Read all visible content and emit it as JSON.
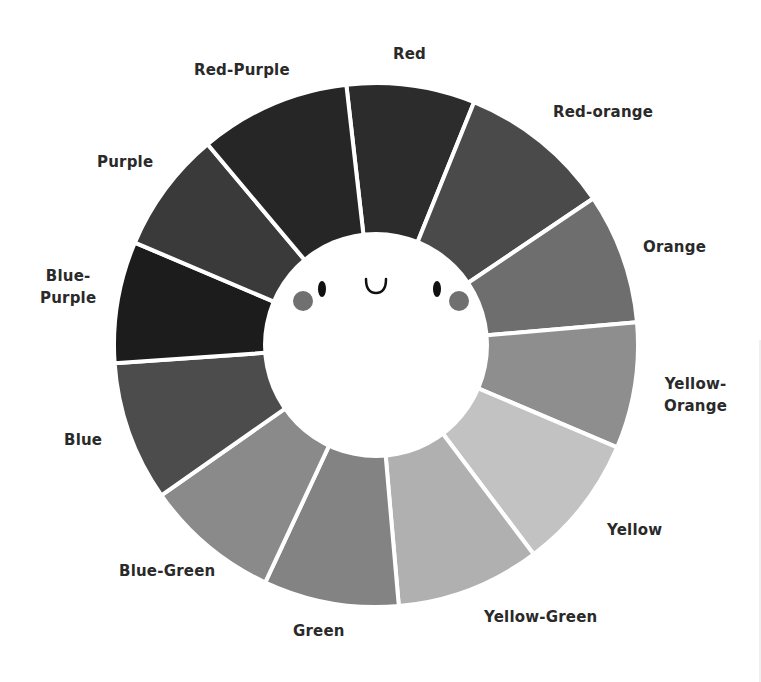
{
  "diagram": {
    "type": "color-wheel",
    "segment_count": 12,
    "center": {
      "x": 376,
      "y": 345
    },
    "outer_radius": 262,
    "inner_radius": 113,
    "divider_color": "#ffffff",
    "segments": [
      {
        "name": "Red",
        "start_deg": -6.5,
        "end_deg": 22,
        "fill": "#2c2c2c"
      },
      {
        "name": "Red-orange",
        "start_deg": 22,
        "end_deg": 56,
        "fill": "#4a4a4a"
      },
      {
        "name": "Orange",
        "start_deg": 56,
        "end_deg": 85,
        "fill": "#6e6e6e"
      },
      {
        "name": "Yellow-Orange",
        "start_deg": 85,
        "end_deg": 113,
        "fill": "#8e8e8e"
      },
      {
        "name": "Yellow",
        "start_deg": 113,
        "end_deg": 143,
        "fill": "#c2c2c2"
      },
      {
        "name": "Yellow-Green",
        "start_deg": 143,
        "end_deg": 175,
        "fill": "#b0b0b0"
      },
      {
        "name": "Green",
        "start_deg": 175,
        "end_deg": 205,
        "fill": "#838383"
      },
      {
        "name": "Blue-Green",
        "start_deg": 205,
        "end_deg": 235,
        "fill": "#8a8a8a"
      },
      {
        "name": "Blue",
        "start_deg": 235,
        "end_deg": 266,
        "fill": "#4c4c4c"
      },
      {
        "name": "Blue-Purple",
        "start_deg": 266,
        "end_deg": 293,
        "fill": "#1c1c1c"
      },
      {
        "name": "Purple",
        "start_deg": 293,
        "end_deg": 320,
        "fill": "#3a3a3a"
      },
      {
        "name": "Red-Purple",
        "start_deg": 320,
        "end_deg": 353.5,
        "fill": "#262626"
      }
    ],
    "face": {
      "eyes": [
        {
          "x": 322,
          "y": 289
        },
        {
          "x": 437,
          "y": 289
        }
      ],
      "mouth": {
        "x": 376,
        "y": 285
      },
      "cheeks": [
        {
          "x": 303,
          "y": 301
        },
        {
          "x": 459,
          "y": 301
        }
      ],
      "eye_color": "#111111",
      "cheek_color": "#707070"
    }
  },
  "labels": {
    "red": "Red",
    "red_orange": "Red-orange",
    "orange": "Orange",
    "yellow_orange_1": "Yellow-",
    "yellow_orange_2": "Orange",
    "yellow": "Yellow",
    "yellow_green": "Yellow-Green",
    "green": "Green",
    "blue_green": "Blue-Green",
    "blue": "Blue",
    "blue_purple_1": "Blue-",
    "blue_purple_2": "Purple",
    "purple": "Purple",
    "red_purple": "Red-Purple"
  }
}
